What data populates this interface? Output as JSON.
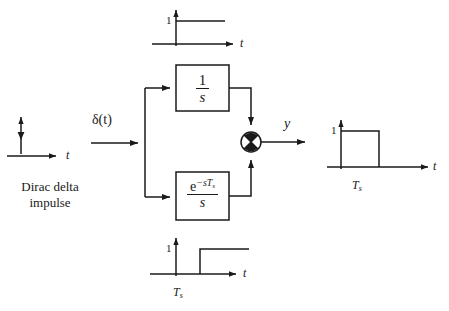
{
  "diagram": {
    "stroke_color": "#1a1a1a",
    "background": "#ffffff",
    "input": {
      "signal_label": "δ(t)",
      "caption_line1": "Dirac delta",
      "caption_line2": "impulse",
      "plot": {
        "axis_label": "t",
        "type": "impulse",
        "impulse_time": 0,
        "impulse_weight": 1
      }
    },
    "blocks": [
      {
        "name": "integrator",
        "numerator": "1",
        "denominator": "s",
        "transfer_function": "1/s"
      },
      {
        "name": "delayed-integrator",
        "numerator_base": "e",
        "numerator_exponent": "−sT",
        "numerator_exponent_sub": "s",
        "denominator": "s",
        "transfer_function": "e^{-sT_s}/s"
      }
    ],
    "summing_junction": {
      "symbol": "⊗",
      "output_label": "y"
    },
    "plots": [
      {
        "name": "top-step-plot",
        "position": "top",
        "tick_label": "1",
        "axis_label": "t",
        "description": "unit step at t = 0",
        "step_time_label": ""
      },
      {
        "name": "bottom-delayed-step-plot",
        "position": "bottom",
        "tick_label": "1",
        "axis_label": "t",
        "description": "unit step delayed to t = Ts",
        "step_time_label": "T",
        "step_time_sub": "s"
      },
      {
        "name": "output-pulse-plot",
        "position": "right",
        "tick_label": "1",
        "axis_label": "t",
        "description": "rectangular pulse of height 1 from t = 0 to t = Ts",
        "pulse_end_label": "T",
        "pulse_end_sub": "s"
      }
    ]
  }
}
